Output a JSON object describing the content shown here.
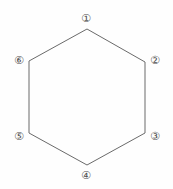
{
  "figure": {
    "shape": "hexagon",
    "background_color": "#fefefe",
    "stroke_color": "#6a6a6a",
    "stroke_width": 1,
    "label_color": "#4f4f4f",
    "width": 173,
    "height": 189
  },
  "hexagon": {
    "vertices": [
      {
        "id": "v1",
        "x": 87,
        "y": 29
      },
      {
        "id": "v2",
        "x": 145,
        "y": 62
      },
      {
        "id": "v3",
        "x": 145,
        "y": 133
      },
      {
        "id": "v4",
        "x": 87,
        "y": 165
      },
      {
        "id": "v5",
        "x": 29,
        "y": 133
      },
      {
        "id": "v6",
        "x": 29,
        "y": 61
      }
    ],
    "points_attr": "87,29 145,62 145,133 87,165 29,133 29,61"
  },
  "labels": [
    {
      "id": "label-1",
      "text": "①",
      "number": 1,
      "x": 86,
      "y": 19,
      "position": "top"
    },
    {
      "id": "label-2",
      "text": "②",
      "number": 2,
      "x": 155,
      "y": 61,
      "position": "upper-right"
    },
    {
      "id": "label-3",
      "text": "③",
      "number": 3,
      "x": 155,
      "y": 137,
      "position": "lower-right"
    },
    {
      "id": "label-4",
      "text": "④",
      "number": 4,
      "x": 86,
      "y": 176,
      "position": "bottom"
    },
    {
      "id": "label-5",
      "text": "⑤",
      "number": 5,
      "x": 19,
      "y": 137,
      "position": "lower-left"
    },
    {
      "id": "label-6",
      "text": "⑥",
      "number": 6,
      "x": 19,
      "y": 61,
      "position": "upper-left"
    }
  ]
}
